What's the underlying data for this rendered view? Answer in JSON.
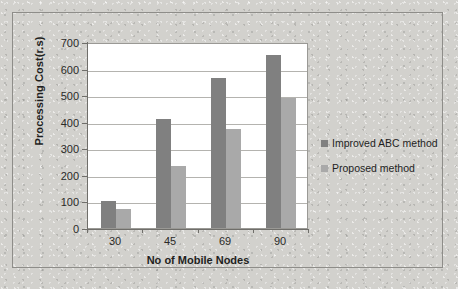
{
  "chart_data": {
    "type": "bar",
    "title": "",
    "subtitle": "",
    "categories": [
      "30",
      "45",
      "69",
      "90"
    ],
    "series": [
      {
        "name": "Improved ABC method",
        "values": [
          100,
          410,
          565,
          650
        ],
        "color": "#808080"
      },
      {
        "name": "Proposed method",
        "values": [
          70,
          235,
          372,
          490
        ],
        "color": "#a9a9a9"
      }
    ],
    "xlabel": "No of Mobile Nodes",
    "ylabel": "Processing Cost(r.s)",
    "ylim": [
      0,
      700
    ],
    "ytick_step": 100,
    "yticks": [
      "700",
      "600",
      "500",
      "400",
      "300",
      "200",
      "100",
      "0"
    ],
    "grid": true,
    "legend_position": "right"
  },
  "legend": {
    "entries": [
      {
        "label": "Improved ABC method",
        "color": "#808080"
      },
      {
        "label": "Proposed method",
        "color": "#a9a9a9"
      }
    ]
  }
}
